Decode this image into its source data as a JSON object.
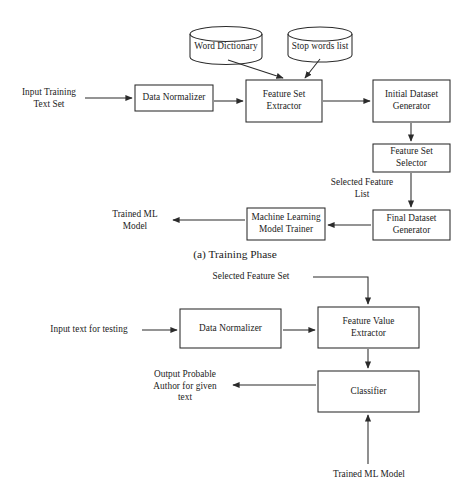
{
  "figure": {
    "domain_type": "diagram",
    "colors": {
      "stroke": "#2b2b2b",
      "text": "#1b1b1b",
      "background": "#ffffff"
    },
    "captions": [
      {
        "id": "caption-a",
        "text": "(a) Training Phase"
      }
    ]
  },
  "training_phase": {
    "inputs": [
      {
        "id": "input-training-text-set",
        "text": "Input Training\nText Set"
      }
    ],
    "datastores": [
      {
        "id": "word-dictionary",
        "shape": "cylinder",
        "text": "Word Dictionary"
      },
      {
        "id": "stop-words-list",
        "shape": "cylinder",
        "text": "Stop words list"
      }
    ],
    "processes": [
      {
        "id": "data-normalizer",
        "text": "Data Normalizer"
      },
      {
        "id": "feature-set-extractor",
        "text": "Feature Set\nExtractor"
      },
      {
        "id": "initial-dataset-generator",
        "text": "Initial Dataset\nGenerator"
      },
      {
        "id": "feature-set-selector",
        "text": "Feature Set\nSelector"
      },
      {
        "id": "final-dataset-generator",
        "text": "Final Dataset\nGenerator"
      },
      {
        "id": "machine-learning-model-trainer",
        "text": "Machine Learning\nModel Trainer"
      }
    ],
    "edge_labels": [
      {
        "id": "selected-feature-list",
        "text": "Selected Feature\nList"
      }
    ],
    "outputs": [
      {
        "id": "trained-ml-model-output",
        "text": "Trained ML\nModel"
      }
    ]
  },
  "testing_phase": {
    "inputs": [
      {
        "id": "input-text-for-testing",
        "text": "Input text for testing"
      },
      {
        "id": "selected-feature-set",
        "text": "Selected Feature Set"
      },
      {
        "id": "trained-ml-model-input",
        "text": "Trained ML Model"
      }
    ],
    "processes": [
      {
        "id": "data-normalizer-test",
        "text": "Data Normalizer"
      },
      {
        "id": "feature-value-extractor",
        "text": "Feature Value\nExtractor"
      },
      {
        "id": "classifier",
        "text": "Classifier"
      }
    ],
    "outputs": [
      {
        "id": "output-probable-author",
        "text": "Output Probable\nAuthor for given\ntext"
      }
    ]
  }
}
